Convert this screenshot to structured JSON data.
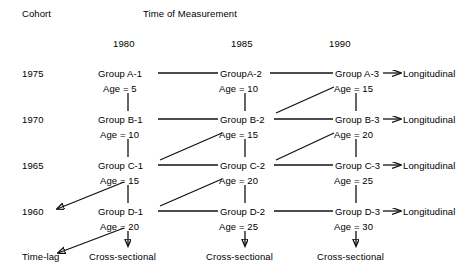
{
  "figure": {
    "header_cohort": "Cohort",
    "header_time": "Time of Measurement"
  },
  "columns": [
    {
      "year": "1980"
    },
    {
      "year": "1985"
    },
    {
      "year": "1990"
    }
  ],
  "cohorts": [
    {
      "year": "1975"
    },
    {
      "year": "1970"
    },
    {
      "year": "1965"
    },
    {
      "year": "1960"
    }
  ],
  "cells": {
    "a1": {
      "group": "Group A-1",
      "age": "Age = 5"
    },
    "a2": {
      "group": "GroupA-2",
      "age": "Age = 10"
    },
    "a3": {
      "group": "Group A-3",
      "age": "Age = 15"
    },
    "b1": {
      "group": "Group B-1",
      "age": "Age = 10"
    },
    "b2": {
      "group": "Group B-2",
      "age": "Age = 15"
    },
    "b3": {
      "group": "Group B-3",
      "age": "Age = 20"
    },
    "c1": {
      "group": "Group C-1",
      "age": "Age = 15"
    },
    "c2": {
      "group": "Group C-2",
      "age": "Age = 20"
    },
    "c3": {
      "group": "Group C-3",
      "age": "Age = 25"
    },
    "d1": {
      "group": "Group D-1",
      "age": "Age = 20"
    },
    "d2": {
      "group": "Group D-2",
      "age": "Age = 25"
    },
    "d3": {
      "group": "Group D-3",
      "age": "Age = 30"
    }
  },
  "design_labels": {
    "longitudinal_a": "Longitudinal",
    "longitudinal_b": "Longitudinal",
    "longitudinal_c": "Longitudinal",
    "longitudinal_d": "Longitudinal",
    "time_lag": "Time-lag",
    "cross_sectional_1": "Cross-sectional",
    "cross_sectional_2": "Cross-sectional",
    "cross_sectional_3": "Cross-sectional"
  },
  "colors": {
    "ink": "#111111",
    "background": "#ffffff"
  }
}
